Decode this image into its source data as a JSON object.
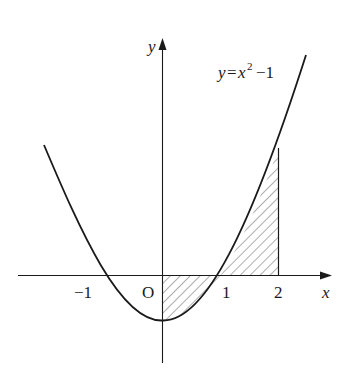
{
  "figure": {
    "curve_label": "y=x²−1",
    "curve_label_parts": {
      "y": "y",
      "eq": "=",
      "x": "x",
      "sup": "2",
      "rest": "−1"
    },
    "axis_x_label": "x",
    "axis_y_label": "y",
    "origin_label": "O",
    "ticks": {
      "neg1": "−1",
      "one": "1",
      "two": "2"
    },
    "shaded_region": "between y=x²−1 and x-axis, from x=0 to x=2",
    "colors": {
      "stroke": "#1a1a1a",
      "background": "#ffffff"
    }
  }
}
